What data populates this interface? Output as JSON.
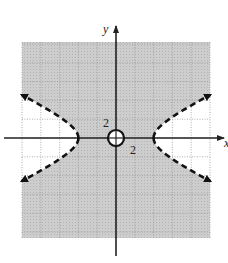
{
  "chart_data": {
    "type": "line",
    "title": "",
    "xlabel": "x",
    "ylabel": "y",
    "xlim": [
      -10,
      10
    ],
    "ylim": [
      -10,
      10
    ],
    "grid": true,
    "grid_step": 2,
    "tick_labels": {
      "x": "2",
      "y": "2"
    },
    "shaded_region": "between branches: x^2/16 - y^2/4 < 1",
    "shade_color": "#c8c8c8",
    "series": [
      {
        "name": "hyperbola boundary",
        "equation": "x^2/16 - y^2/4 = 1",
        "style": "dashed",
        "vertices": [
          [
            -4,
            0
          ],
          [
            4,
            0
          ]
        ],
        "endpoints_with_arrows": [
          [
            -10,
            4.6
          ],
          [
            -10,
            -4.6
          ],
          [
            10,
            4.6
          ],
          [
            10,
            -4.6
          ]
        ]
      }
    ],
    "excluded_point": {
      "x": 0,
      "y": 0,
      "marker": "open-circle"
    },
    "legend": "none"
  },
  "labels": {
    "x_axis": "x",
    "y_axis": "y",
    "x_tick": "2",
    "y_tick": "2"
  },
  "colors": {
    "shade": "#c8c8c8",
    "grid": "#9a9a9a",
    "axis": "#222222",
    "curve": "#111111"
  }
}
